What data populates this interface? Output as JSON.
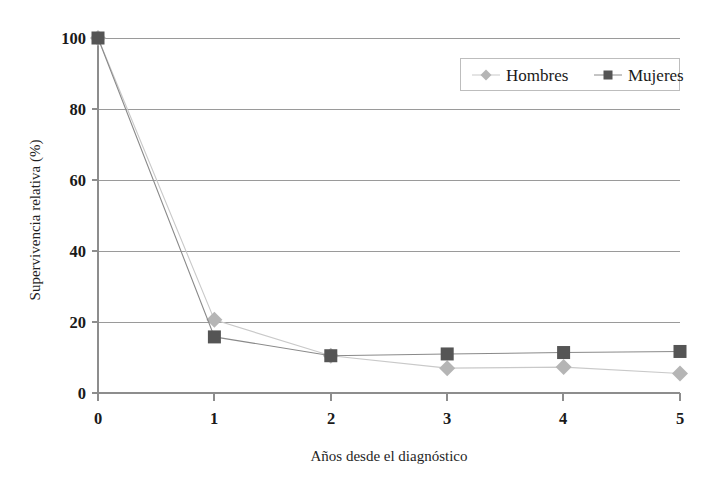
{
  "chart_data": {
    "type": "line",
    "title": "",
    "xlabel": "Años desde el diagnóstico",
    "ylabel": "Supervivencia relativa (%)",
    "x": [
      0,
      1,
      2,
      3,
      4,
      5
    ],
    "xticklabels": [
      "0",
      "1",
      "2",
      "3",
      "4",
      "5"
    ],
    "yticklabels": [
      "0",
      "20",
      "40",
      "60",
      "80",
      "100"
    ],
    "yticks": [
      0,
      20,
      40,
      60,
      80,
      100
    ],
    "xlim": [
      0,
      5
    ],
    "ylim": [
      0,
      100
    ],
    "grid": "horizontal",
    "legend_position": "top-right",
    "series": [
      {
        "name": "Hombres",
        "marker": "diamond",
        "color": "#b5b5b5",
        "line_color": "#c9c9c9",
        "values": [
          100,
          20.6,
          10.5,
          7.0,
          7.3,
          5.5
        ]
      },
      {
        "name": "Mujeres",
        "marker": "square",
        "color": "#555555",
        "line_color": "#8a8a8a",
        "values": [
          100,
          15.8,
          10.5,
          11.0,
          11.4,
          11.7
        ]
      }
    ]
  },
  "axes": {
    "y_title": "Supervivencia relativa (%)",
    "x_title": "Años desde el diagnóstico",
    "y_tick_0": "0",
    "y_tick_1": "20",
    "y_tick_2": "40",
    "y_tick_3": "60",
    "y_tick_4": "80",
    "y_tick_5": "100",
    "x_tick_0": "0",
    "x_tick_1": "1",
    "x_tick_2": "2",
    "x_tick_3": "3",
    "x_tick_4": "4",
    "x_tick_5": "5"
  },
  "legend": {
    "entry_hombres": "Hombres",
    "entry_mujeres": "Mujeres"
  },
  "colors": {
    "hombres": "#b5b5b5",
    "mujeres": "#555555",
    "grid": "#9a9a9a",
    "axis": "#8d8d8d",
    "background": "#ffffff"
  }
}
